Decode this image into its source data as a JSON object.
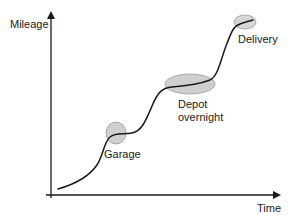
{
  "diagram": {
    "axes": {
      "y_label": "Mileage",
      "x_label": "Time"
    },
    "annotations": [
      {
        "id": "garage",
        "label": "Garage"
      },
      {
        "id": "depot",
        "label_line1": "Depot",
        "label_line2": "overnight"
      },
      {
        "id": "delivery",
        "label": "Delivery"
      }
    ],
    "colors": {
      "line": "#1a1a1a",
      "ellipse_fill": "#cfcfcf",
      "ellipse_stroke": "#9a9a9a",
      "text": "#1a1a1a"
    }
  }
}
